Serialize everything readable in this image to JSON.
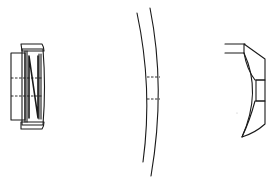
{
  "figure": {
    "type": "technical-line-drawing",
    "background": "#ffffff",
    "line_color": "#1a1a1a",
    "components": [
      {
        "id": "left",
        "description": "cylindrical cap assembly with hatched outer ring and internal coil spring",
        "features": [
          "outer-body",
          "hatched-ring-top",
          "hatched-ring-bottom",
          "coil-spring",
          "dashed-centerlines"
        ]
      },
      {
        "id": "middle",
        "description": "curved thin shell / lens section with central dashed opening",
        "features": [
          "inner-arc",
          "outer-arc",
          "dashed-opening"
        ]
      },
      {
        "id": "right",
        "description": "hatched concave section with central window",
        "features": [
          "top-lip",
          "hatched-upper-section",
          "central-window",
          "hatched-lower-section",
          "concave-inner-arc"
        ]
      }
    ]
  }
}
